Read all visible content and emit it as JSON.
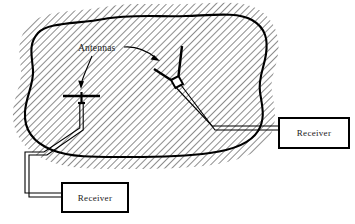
{
  "diagram": {
    "type": "technical-illustration",
    "title_visible": false,
    "background_color": "#ffffff",
    "line_color": "#000000",
    "hatch_color": "#333333",
    "labels": {
      "antennas": "Antennas",
      "receiver_right": "Receiver",
      "receiver_bottom": "Receiver"
    },
    "enclosure": {
      "name": "hatched-region-boundary",
      "description": "irregular closed blob outline with exterior diagonal hatching",
      "hatch_angle_deg": 45,
      "stroke_width": 2
    },
    "antennas": [
      {
        "id": "left-antenna",
        "style": "T-dipole",
        "label": "Antennas",
        "connected_to": "receiver_bottom"
      },
      {
        "id": "right-antenna",
        "style": "V-dipole",
        "label": "Antennas",
        "connected_to": "receiver_right"
      }
    ],
    "receivers": [
      {
        "id": "receiver_right",
        "label": "Receiver",
        "x": 279,
        "y": 118,
        "width": 70,
        "height": 30
      },
      {
        "id": "receiver_bottom",
        "label": "Receiver",
        "x": 62,
        "y": 183,
        "width": 66,
        "height": 29
      }
    ],
    "cables": [
      {
        "id": "left-coax",
        "from": "left-antenna",
        "to": "receiver_bottom",
        "style": "double-line-coax"
      },
      {
        "id": "right-coax",
        "from": "right-antenna",
        "to": "receiver_right",
        "style": "double-line-coax"
      }
    ],
    "arrows": [
      {
        "id": "arrow-to-left-antenna",
        "from": "Antennas",
        "to": "left-antenna"
      },
      {
        "id": "arrow-to-right-antenna",
        "from": "Antennas",
        "to": "right-antenna"
      }
    ]
  }
}
